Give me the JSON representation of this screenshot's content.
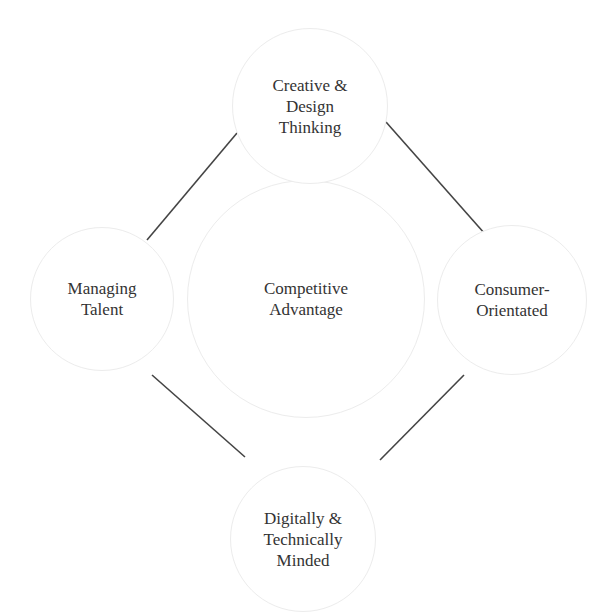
{
  "diagram": {
    "center": {
      "label": "Competitive\nAdvantage"
    },
    "nodes": {
      "top": {
        "label": "Creative &\nDesign\nThinking"
      },
      "left": {
        "label": "Managing\nTalent"
      },
      "right": {
        "label": "Consumer-\nOrientated"
      },
      "bottom": {
        "label": "Digitally &\nTechnically\nMinded"
      }
    },
    "connections": [
      {
        "from": "left",
        "to": "top"
      },
      {
        "from": "top",
        "to": "right"
      },
      {
        "from": "left",
        "to": "bottom"
      },
      {
        "from": "right",
        "to": "bottom"
      }
    ],
    "colors": {
      "line": "#444444",
      "circle_border": "#ececec",
      "text": "#333333",
      "background": "#ffffff"
    }
  }
}
